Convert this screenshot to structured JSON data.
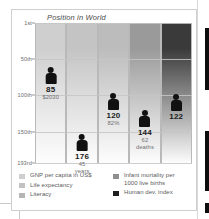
{
  "panel": {
    "title": "Position in World"
  },
  "chart_data": {
    "type": "bar",
    "title": "Position in World",
    "xlabel": "",
    "ylabel": "Position in World",
    "ylim": [
      1,
      193
    ],
    "grid": true,
    "legend_position": "bottom",
    "y_ticks": [
      "1st",
      "50th",
      "100th",
      "150th",
      "193rd"
    ],
    "y_tick_values": [
      1,
      50,
      100,
      150,
      193
    ],
    "categories": [
      "GNP per capita in US$",
      "Life expectancy",
      "Literacy",
      "Infant mortality per 1000 live births",
      "Human dev. index"
    ],
    "values": [
      85,
      176,
      120,
      144,
      122
    ],
    "annotations": [
      "$2030",
      "45 years",
      "82%",
      "62 deaths",
      ""
    ],
    "series": [
      {
        "name": "Position in World",
        "values": [
          85,
          176,
          120,
          144,
          122
        ]
      }
    ],
    "points": [
      {
        "category": "GNP per capita in US$",
        "rank": 85,
        "rank_label": "85",
        "detail_line1": "$2030",
        "detail_line2": "",
        "color": "#cfcfcf"
      },
      {
        "category": "Life expectancy",
        "rank": 176,
        "rank_label": "176",
        "detail_line1": "45",
        "detail_line2": "years",
        "color": "#c4c4c4"
      },
      {
        "category": "Literacy",
        "rank": 120,
        "rank_label": "120",
        "detail_line1": "82%",
        "detail_line2": "",
        "color": "#bcbcbc"
      },
      {
        "category": "Infant mortality per 1000 live births",
        "rank": 144,
        "rank_label": "144",
        "detail_line1": "62",
        "detail_line2": "deaths",
        "color": "#9a9a9a"
      },
      {
        "category": "Human dev. index",
        "rank": 122,
        "rank_label": "122",
        "detail_line1": "",
        "detail_line2": "",
        "color": "#3a3a3a"
      }
    ]
  },
  "ticks": [
    {
      "label": "1st"
    },
    {
      "label": "50th"
    },
    {
      "label": "100th"
    },
    {
      "label": "150th"
    },
    {
      "label": "193rd"
    }
  ],
  "markers": [
    {
      "value": "85",
      "sub1": "$2030",
      "sub2": ""
    },
    {
      "value": "176",
      "sub1": "45",
      "sub2": "years"
    },
    {
      "value": "120",
      "sub1": "82%",
      "sub2": ""
    },
    {
      "value": "144",
      "sub1": "62",
      "sub2": "deaths"
    },
    {
      "value": "122",
      "sub1": "",
      "sub2": ""
    }
  ],
  "legend": {
    "left": [
      {
        "label": "GNP per capita in US$",
        "color": "#cfcfcf"
      },
      {
        "label": "Life expectancy",
        "color": "#c2c2c2"
      },
      {
        "label": "Literacy",
        "color": "#b5b5b5"
      }
    ],
    "right": [
      {
        "label": "Infant mortality per",
        "label2": "1000 live births",
        "color": "#8f8f8f"
      },
      {
        "label": "Human dev. index",
        "label2": "",
        "color": "#1f1f1f"
      }
    ]
  }
}
